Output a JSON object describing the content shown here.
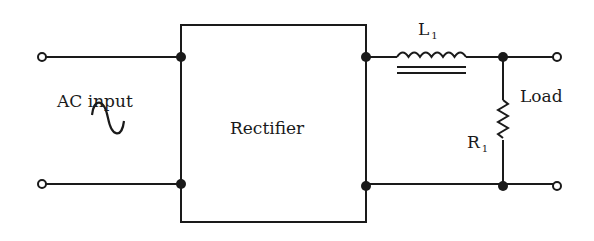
{
  "diagram": {
    "type": "circuit-schematic",
    "labels": {
      "ac_input": "AC input",
      "rectifier": "Rectifier",
      "inductor": {
        "main": "L",
        "sub": "1"
      },
      "resistor": {
        "main": "R",
        "sub": "1"
      },
      "load": "Load"
    },
    "components": [
      {
        "id": "ac_source",
        "kind": "ac-voltage-source",
        "symbol": "sine-wave"
      },
      {
        "id": "rectifier",
        "kind": "block"
      },
      {
        "id": "L1",
        "kind": "iron-core-inductor"
      },
      {
        "id": "R1",
        "kind": "resistor"
      }
    ],
    "colors": {
      "line": "#1a1a1a",
      "background": "#ffffff"
    }
  }
}
